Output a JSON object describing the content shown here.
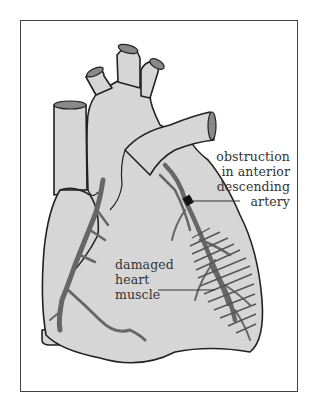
{
  "figure": {
    "colors": {
      "background": "#ffffff",
      "frame_border": "#444444",
      "heart_fill": "#d6d6d6",
      "outline": "#222222",
      "artery": "#6a6a6a",
      "obstruction": "#111111",
      "hatching": "#555555",
      "label_text": "#333333"
    }
  },
  "labels": {
    "obstruction": {
      "lines": [
        "obstruction",
        "in anterior",
        "descending",
        "artery"
      ]
    },
    "damaged": {
      "lines": [
        "damaged",
        "heart",
        "muscle"
      ]
    }
  }
}
